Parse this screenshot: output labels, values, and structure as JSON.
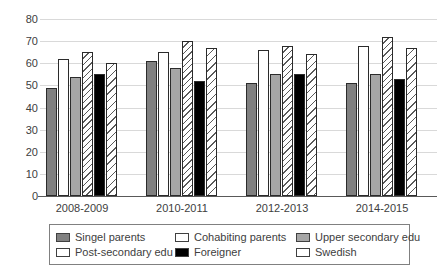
{
  "chart_data": {
    "type": "bar",
    "title": "",
    "xlabel": "",
    "ylabel": "",
    "categories": [
      "2008-2009",
      "2010-2011",
      "2012-2013",
      "2014-2015"
    ],
    "series": [
      {
        "name": "Singel parents",
        "fill": "#808080",
        "hatch": false,
        "values": [
          49,
          61,
          51,
          51
        ]
      },
      {
        "name": "Cohabiting parents",
        "fill": "#ffffff",
        "hatch": false,
        "values": [
          62,
          65,
          66,
          68
        ]
      },
      {
        "name": "Upper secondary edu",
        "fill": "#a6a6a6",
        "hatch": false,
        "values": [
          54,
          58,
          55,
          55
        ]
      },
      {
        "name": "Post-secondary edu",
        "fill": "#ffffff",
        "hatch": true,
        "values": [
          65,
          70,
          68,
          72
        ]
      },
      {
        "name": "Foreigner",
        "fill": "#000000",
        "hatch": false,
        "values": [
          55,
          52,
          55,
          53
        ]
      },
      {
        "name": "Swedish",
        "fill": "#ffffff",
        "hatch": true,
        "values": [
          60,
          67,
          64,
          67
        ]
      }
    ],
    "ylim": [
      0,
      80
    ],
    "ytick_step": 10,
    "grid": true,
    "legend_position": "bottom",
    "colors": {
      "gridline": "#d9d9d9",
      "axis_line": "#595959",
      "axis_text": "#404040",
      "bar_outline": "#2b2b2b"
    }
  }
}
